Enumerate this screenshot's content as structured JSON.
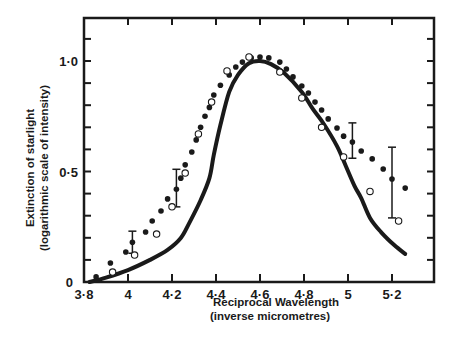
{
  "chart_data": {
    "type": "scatter",
    "title": "",
    "xlabel": "Reciprocal  Wavelength",
    "xlabel_sub": "(inverse micrometres)",
    "ylabel": "Extinction of starlight",
    "ylabel_sub": "(logarithmic scale of intensity)",
    "xlim": [
      3.8,
      5.33
    ],
    "ylim": [
      0,
      1.2
    ],
    "grid": false,
    "legend": null,
    "x_ticks": [
      {
        "value": 3.8,
        "label": "3·8"
      },
      {
        "value": 4.0,
        "label": "4"
      },
      {
        "value": 4.2,
        "label": "4·2"
      },
      {
        "value": 4.4,
        "label": "4·4"
      },
      {
        "value": 4.6,
        "label": "4·6"
      },
      {
        "value": 4.8,
        "label": "4·8"
      },
      {
        "value": 5.0,
        "label": "5"
      },
      {
        "value": 5.2,
        "label": "5·2"
      }
    ],
    "y_ticks": [
      {
        "value": 0,
        "label": "0"
      },
      {
        "value": 0.5,
        "label": "0·5"
      },
      {
        "value": 1.0,
        "label": "1·0"
      }
    ],
    "y_minor_step": 0.1,
    "series": [
      {
        "name": "Observed extinction (filled dots)",
        "style": "filled-dot",
        "points": [
          [
            3.855,
            0.023
          ],
          [
            3.92,
            0.086
          ],
          [
            3.99,
            0.136
          ],
          [
            4.02,
            0.18
          ],
          [
            4.08,
            0.226
          ],
          [
            4.11,
            0.276
          ],
          [
            4.15,
            0.321
          ],
          [
            4.18,
            0.376
          ],
          [
            4.22,
            0.42
          ],
          [
            4.24,
            0.47
          ],
          [
            4.26,
            0.53
          ],
          [
            4.29,
            0.588
          ],
          [
            4.31,
            0.643
          ],
          [
            4.33,
            0.7
          ],
          [
            4.35,
            0.75
          ],
          [
            4.37,
            0.79
          ],
          [
            4.39,
            0.846
          ],
          [
            4.42,
            0.89
          ],
          [
            4.46,
            0.937
          ],
          [
            4.49,
            0.973
          ],
          [
            4.52,
            0.995
          ],
          [
            4.56,
            1.014
          ],
          [
            4.6,
            1.018
          ],
          [
            4.64,
            1.014
          ],
          [
            4.69,
            0.995
          ],
          [
            4.72,
            0.964
          ],
          [
            4.75,
            0.928
          ],
          [
            4.79,
            0.887
          ],
          [
            4.82,
            0.855
          ],
          [
            4.85,
            0.814
          ],
          [
            4.88,
            0.778
          ],
          [
            4.91,
            0.738
          ],
          [
            4.95,
            0.697
          ],
          [
            4.98,
            0.66
          ],
          [
            5.02,
            0.633
          ],
          [
            5.06,
            0.593
          ],
          [
            5.11,
            0.557
          ],
          [
            5.16,
            0.511
          ],
          [
            5.2,
            0.466
          ],
          [
            5.26,
            0.425
          ]
        ],
        "error_bars": [
          {
            "x": 4.02,
            "y": 0.18,
            "low": 0.13,
            "high": 0.23
          },
          {
            "x": 4.22,
            "y": 0.42,
            "low": 0.34,
            "high": 0.51
          },
          {
            "x": 5.02,
            "y": 0.633,
            "low": 0.56,
            "high": 0.72
          },
          {
            "x": 5.2,
            "y": 0.466,
            "low": 0.29,
            "high": 0.61
          }
        ]
      },
      {
        "name": "Observed extinction (open circles)",
        "style": "open-circle",
        "points": [
          [
            3.93,
            0.045
          ],
          [
            4.03,
            0.122
          ],
          [
            4.13,
            0.217
          ],
          [
            4.2,
            0.34
          ],
          [
            4.26,
            0.493
          ],
          [
            4.32,
            0.67
          ],
          [
            4.38,
            0.814
          ],
          [
            4.45,
            0.955
          ],
          [
            4.55,
            1.018
          ],
          [
            4.69,
            0.95
          ],
          [
            4.79,
            0.833
          ],
          [
            4.88,
            0.7
          ],
          [
            4.98,
            0.566
          ],
          [
            5.1,
            0.41
          ],
          [
            5.23,
            0.276
          ]
        ]
      },
      {
        "name": "Theoretical curve",
        "style": "solid-line",
        "points": [
          [
            3.825,
            0.0
          ],
          [
            3.9,
            0.02
          ],
          [
            4.0,
            0.054
          ],
          [
            4.1,
            0.1
          ],
          [
            4.18,
            0.145
          ],
          [
            4.24,
            0.199
          ],
          [
            4.28,
            0.27
          ],
          [
            4.33,
            0.37
          ],
          [
            4.37,
            0.47
          ],
          [
            4.39,
            0.575
          ],
          [
            4.42,
            0.71
          ],
          [
            4.46,
            0.86
          ],
          [
            4.5,
            0.937
          ],
          [
            4.55,
            0.99
          ],
          [
            4.6,
            1.0
          ],
          [
            4.65,
            0.986
          ],
          [
            4.71,
            0.946
          ],
          [
            4.79,
            0.86
          ],
          [
            4.84,
            0.783
          ],
          [
            4.89,
            0.715
          ],
          [
            4.95,
            0.615
          ],
          [
            4.99,
            0.525
          ],
          [
            5.03,
            0.434
          ],
          [
            5.06,
            0.38
          ],
          [
            5.1,
            0.29
          ],
          [
            5.15,
            0.226
          ],
          [
            5.21,
            0.167
          ],
          [
            5.26,
            0.127
          ]
        ]
      }
    ]
  },
  "layout": {
    "plot_left_px": 84,
    "plot_right_px": 434,
    "plot_top_px": 18,
    "plot_bottom_px": 282,
    "x_origin_value": 3.8,
    "x_px_per_unit": 220,
    "y_px_per_unit": 221
  },
  "colors": {
    "ink": "#1a1a1a",
    "background": "#ffffff"
  }
}
